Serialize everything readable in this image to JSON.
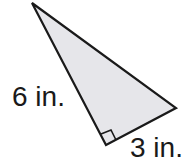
{
  "diagram": {
    "shape": "right triangle",
    "fill_color": "#e6e6ea",
    "stroke_color": "#1a1a1a",
    "labels": {
      "left_leg": "6 in.",
      "bottom_leg": "3 in."
    },
    "right_angle_marker": true
  }
}
